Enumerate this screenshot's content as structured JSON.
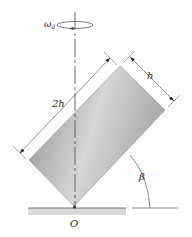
{
  "diagram": {
    "labels": {
      "omega": "ω",
      "omega_sub": "0",
      "length_long": "2h",
      "length_short": "h",
      "angle": "β",
      "pivot": "O"
    },
    "colors": {
      "block_dark": "#8c8c8c",
      "block_light": "#d8d8d8",
      "line": "#333333",
      "ground_hatch": "#9a9a9a"
    }
  }
}
